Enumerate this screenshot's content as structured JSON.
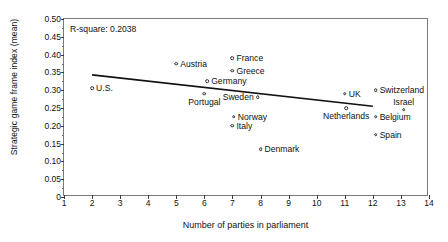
{
  "figure": {
    "annotation": "R-square: 0.2038"
  },
  "chart_data": {
    "type": "scatter",
    "title": "",
    "xlabel": "Number of parties in parliament",
    "ylabel": "Strategic game frame index (mean)",
    "xlim": [
      1,
      14
    ],
    "ylim": [
      0,
      0.5
    ],
    "grid": false,
    "legend": "none",
    "xticks": [
      "1",
      "2",
      "3",
      "4",
      "5",
      "6",
      "7",
      "8",
      "9",
      "10",
      "11",
      "12",
      "13",
      "14"
    ],
    "yticks": [
      "0",
      "0.05",
      "0.10",
      "0.15",
      "0.20",
      "0.25",
      "0.30",
      "0.35",
      "0.40",
      "0.45",
      "0.50"
    ],
    "annotations": [
      "R-square: 0.2038"
    ],
    "r_square": 0.2038,
    "points": [
      {
        "label": "U.S.",
        "x": 2.0,
        "y": 0.305,
        "label_side": "right"
      },
      {
        "label": "Austria",
        "x": 5.0,
        "y": 0.375,
        "label_side": "right"
      },
      {
        "label": "Portugal",
        "x": 6.0,
        "y": 0.29,
        "label_side": "below-left"
      },
      {
        "label": "Germany",
        "x": 6.1,
        "y": 0.325,
        "label_side": "right"
      },
      {
        "label": "France",
        "x": 7.0,
        "y": 0.39,
        "label_side": "right"
      },
      {
        "label": "Greece",
        "x": 7.0,
        "y": 0.355,
        "label_side": "right"
      },
      {
        "label": "Italy",
        "x": 7.0,
        "y": 0.2,
        "label_side": "right"
      },
      {
        "label": "Norway",
        "x": 7.05,
        "y": 0.225,
        "label_side": "right"
      },
      {
        "label": "Sweden",
        "x": 7.9,
        "y": 0.28,
        "label_side": "left"
      },
      {
        "label": "Denmark",
        "x": 8.0,
        "y": 0.135,
        "label_side": "right"
      },
      {
        "label": "UK",
        "x": 11.0,
        "y": 0.29,
        "label_side": "right"
      },
      {
        "label": "Netherlands",
        "x": 11.05,
        "y": 0.25,
        "label_side": "below-left"
      },
      {
        "label": "Switzerland",
        "x": 12.1,
        "y": 0.3,
        "label_side": "right"
      },
      {
        "label": "Belgium",
        "x": 12.1,
        "y": 0.225,
        "label_side": "right"
      },
      {
        "label": "Spain",
        "x": 12.1,
        "y": 0.175,
        "label_side": "right"
      },
      {
        "label": "Israel",
        "x": 13.1,
        "y": 0.245,
        "label_side": "above"
      }
    ],
    "fit_line": {
      "x0": 2.0,
      "y0": 0.343,
      "x1": 12.0,
      "y1": 0.255
    }
  }
}
